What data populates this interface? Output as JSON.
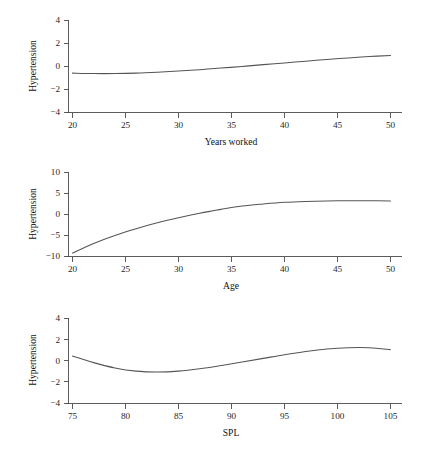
{
  "figure": {
    "background": "#ffffff",
    "line_color": "#555555",
    "axis_color": "#4a4a4a",
    "text_color": "#1a1a1a",
    "panel_count": 3
  },
  "chart_data": [
    {
      "type": "line",
      "title": "",
      "xlabel": "Years worked",
      "ylabel": "Hypertension",
      "xlim": [
        20,
        50
      ],
      "ylim": [
        -4,
        4
      ],
      "xticks": [
        20,
        25,
        30,
        35,
        40,
        45,
        50
      ],
      "xtick_labels": [
        "20",
        "25",
        "30",
        "35",
        "40",
        "45",
        "50"
      ],
      "yticks": [
        4,
        2,
        0,
        -2,
        -4
      ],
      "ytick_labels": [
        "4",
        "2",
        "0",
        "−2",
        "−4"
      ],
      "grid": false,
      "legend": false,
      "series": [
        {
          "name": "smooth-years-worked",
          "x": [
            20,
            22,
            24,
            26,
            28,
            30,
            32,
            34,
            36,
            38,
            40,
            42,
            44,
            46,
            48,
            50
          ],
          "y": [
            -0.62,
            -0.66,
            -0.66,
            -0.62,
            -0.54,
            -0.44,
            -0.32,
            -0.18,
            -0.04,
            0.12,
            0.27,
            0.42,
            0.57,
            0.7,
            0.82,
            0.92
          ]
        }
      ]
    },
    {
      "type": "line",
      "title": "",
      "xlabel": "Age",
      "ylabel": "Hypertension",
      "xlim": [
        20,
        50
      ],
      "ylim": [
        -10,
        10
      ],
      "xticks": [
        20,
        25,
        30,
        35,
        40,
        45,
        50
      ],
      "xtick_labels": [
        "20",
        "25",
        "30",
        "35",
        "40",
        "45",
        "50"
      ],
      "yticks": [
        10,
        5,
        0,
        -5,
        -10
      ],
      "ytick_labels": [
        "10",
        "5",
        "0",
        "−5",
        "−10"
      ],
      "grid": false,
      "legend": false,
      "series": [
        {
          "name": "smooth-age",
          "x": [
            20,
            22,
            24,
            26,
            28,
            30,
            32,
            34,
            36,
            38,
            40,
            42,
            44,
            46,
            48,
            50
          ],
          "y": [
            -9.3,
            -7.0,
            -5.1,
            -3.5,
            -2.1,
            -0.9,
            0.2,
            1.1,
            1.9,
            2.4,
            2.8,
            3.0,
            3.1,
            3.15,
            3.15,
            3.1
          ]
        }
      ]
    },
    {
      "type": "line",
      "title": "",
      "xlabel": "SPL",
      "ylabel": "Hypertension",
      "xlim": [
        75,
        105
      ],
      "ylim": [
        -4,
        4
      ],
      "xticks": [
        75,
        80,
        85,
        90,
        95,
        100,
        105
      ],
      "xtick_labels": [
        "75",
        "80",
        "85",
        "90",
        "95",
        "100",
        "105"
      ],
      "yticks": [
        4,
        2,
        0,
        -2,
        -4
      ],
      "ytick_labels": [
        "4",
        "2",
        "0",
        "−2",
        "−4"
      ],
      "grid": false,
      "legend": false,
      "series": [
        {
          "name": "smooth-spl",
          "x": [
            75,
            77,
            79,
            81,
            83,
            85,
            87,
            89,
            91,
            93,
            95,
            97,
            99,
            101,
            103,
            105
          ],
          "y": [
            0.42,
            -0.2,
            -0.7,
            -1.0,
            -1.08,
            -1.0,
            -0.78,
            -0.48,
            -0.15,
            0.2,
            0.55,
            0.85,
            1.08,
            1.2,
            1.2,
            1.02
          ]
        }
      ]
    }
  ]
}
